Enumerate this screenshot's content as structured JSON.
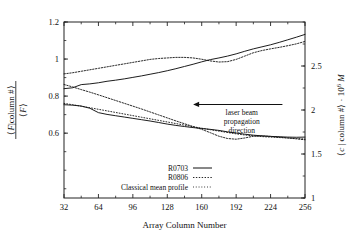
{
  "figure": {
    "background": "#ffffff",
    "frame_color": "#222222"
  },
  "chart_data": {
    "type": "line",
    "title": "",
    "xlabel": "Array Column Number",
    "ylabel_left": "⟨F|column #⟩ / ⟨F⟩",
    "ylabel_right": "⟨c | column #⟩ · 10⁶ M",
    "xlim": [
      32,
      256
    ],
    "ylim_left": [
      0.25,
      1.2
    ],
    "ylim_right": [
      1.0,
      3.0
    ],
    "grid": false,
    "legend_position": "lower-center",
    "xticks": [
      32,
      64,
      96,
      128,
      160,
      192,
      224,
      256
    ],
    "xtick_labels": [
      "32",
      "64",
      "96",
      "128",
      "160",
      "192",
      "224",
      "256"
    ],
    "yticks_left": [
      0.6,
      0.8,
      1.0,
      1.2
    ],
    "ytick_labels_left": [
      "0.6",
      "0.8",
      "1",
      "1.2"
    ],
    "yticks_right": [
      1.0,
      1.5,
      2.0,
      2.5
    ],
    "ytick_labels_right": [
      "1",
      "1.5",
      "2",
      "2.5"
    ],
    "x": [
      32,
      40,
      48,
      56,
      64,
      72,
      80,
      88,
      96,
      104,
      112,
      120,
      128,
      136,
      144,
      152,
      160,
      168,
      176,
      184,
      192,
      200,
      208,
      216,
      224,
      232,
      240,
      248,
      256
    ],
    "series": [
      {
        "name": "R0703",
        "style": "solid",
        "axis": "left",
        "group": "upper",
        "values": [
          0.84,
          0.845,
          0.862,
          0.866,
          0.872,
          0.88,
          0.886,
          0.893,
          0.901,
          0.909,
          0.918,
          0.927,
          0.937,
          0.948,
          0.96,
          0.972,
          0.985,
          0.997,
          1.006,
          1.016,
          1.028,
          1.042,
          1.055,
          1.066,
          1.077,
          1.09,
          1.104,
          1.118,
          1.133
        ]
      },
      {
        "name": "R0806",
        "style": "dotted",
        "axis": "left",
        "group": "upper",
        "values": [
          0.92,
          0.926,
          0.934,
          0.942,
          0.95,
          0.958,
          0.966,
          0.974,
          0.982,
          0.99,
          0.998,
          1.003,
          1.006,
          1.009,
          1.009,
          1.006,
          0.999,
          0.99,
          0.984,
          0.986,
          0.998,
          1.016,
          1.034,
          1.046,
          1.055,
          1.063,
          1.072,
          1.082,
          1.095
        ]
      },
      {
        "name": "R0703",
        "style": "solid",
        "axis": "right",
        "group": "lower",
        "values": [
          2.06,
          2.055,
          2.045,
          2.02,
          1.97,
          1.95,
          1.935,
          1.92,
          1.905,
          1.89,
          1.875,
          1.858,
          1.84,
          1.825,
          1.812,
          1.8,
          1.79,
          1.78,
          1.768,
          1.752,
          1.738,
          1.725,
          1.714,
          1.706,
          1.7,
          1.696,
          1.692,
          1.69,
          1.692
        ]
      },
      {
        "name": "R0806",
        "style": "dotted",
        "axis": "right",
        "group": "lower",
        "values": [
          2.29,
          2.262,
          2.232,
          2.203,
          2.172,
          2.14,
          2.108,
          2.076,
          2.044,
          2.012,
          1.978,
          1.944,
          1.91,
          1.876,
          1.844,
          1.812,
          1.78,
          1.742,
          1.702,
          1.676,
          1.668,
          1.682,
          1.702,
          1.706,
          1.7,
          1.692,
          1.682,
          1.672,
          1.662
        ]
      },
      {
        "name": "Classical mean profile",
        "style": "dashed",
        "axis": "right",
        "group": "lower",
        "values": [
          2.075,
          2.06,
          2.043,
          2.026,
          2.008,
          1.99,
          1.972,
          1.954,
          1.936,
          1.918,
          1.9,
          1.882,
          1.864,
          1.846,
          1.828,
          1.81,
          1.793,
          1.776,
          1.76,
          1.744,
          1.729,
          1.716,
          1.706,
          1.698,
          1.692,
          1.687,
          1.682,
          1.676,
          1.67
        ]
      }
    ],
    "annotation": {
      "lines": [
        "laser beam",
        "propagation",
        "direction"
      ],
      "arrow_direction": "left",
      "arrow_x_start": 235,
      "arrow_x_end": 152,
      "arrow_y_value": 0.755
    }
  },
  "legend": {
    "items": [
      {
        "label": "R0703",
        "style": "solid"
      },
      {
        "label": "R0806",
        "style": "dotted"
      },
      {
        "label": "Classical mean profile",
        "style": "dashed"
      }
    ]
  }
}
